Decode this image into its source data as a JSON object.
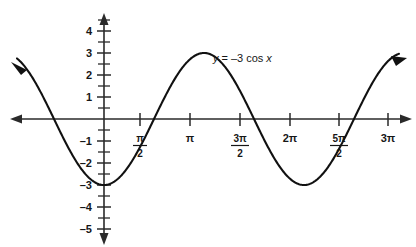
{
  "figure": {
    "background_color": "#ffffff",
    "ink_color": "#111111"
  },
  "chart_data": {
    "type": "line",
    "title": "",
    "subtitle": "",
    "xlabel": "",
    "ylabel": "",
    "equation": "y = -3 cos x",
    "function": "y = -3cos(x)",
    "amplitude": 3,
    "period": "2π",
    "grid": false,
    "legend": null,
    "xlim": [
      -1.5708,
      9.8
    ],
    "ylim": [
      -5,
      4.6
    ],
    "x_tick_labels": [
      "π/2",
      "π",
      "3π/2",
      "2π",
      "5π/2",
      "3π"
    ],
    "x_tick_values": [
      1.5708,
      3.1416,
      4.7124,
      6.2832,
      7.854,
      9.4248
    ],
    "y_tick_labels": [
      "4",
      "3",
      "2",
      "1",
      "-1",
      "-2",
      "-3",
      "-4",
      "-5"
    ],
    "y_tick_values": [
      4,
      3,
      2,
      1,
      -1,
      -2,
      -3,
      -4,
      -5
    ],
    "y_minor_tick_step": 0.5,
    "key_points": [
      {
        "x": 0,
        "y": -3,
        "note": "minimum"
      },
      {
        "x": 1.5708,
        "y": 0,
        "note": "zero crossing"
      },
      {
        "x": 3.1416,
        "y": 3,
        "note": "maximum"
      },
      {
        "x": 4.7124,
        "y": 0,
        "note": "zero crossing"
      },
      {
        "x": 6.2832,
        "y": -3,
        "note": "minimum"
      },
      {
        "x": 7.854,
        "y": 0,
        "note": "zero crossing"
      },
      {
        "x": 9.4248,
        "y": 3,
        "note": "maximum"
      }
    ],
    "arrows": {
      "curve_left": true,
      "curve_right": true,
      "x_axis_left": true,
      "x_axis_right": true,
      "y_axis_up": true,
      "y_axis_down": true
    }
  },
  "x_axis": {
    "ticks": [
      {
        "label_type": "fraction",
        "num": "π",
        "den": "2",
        "value": 1.5708
      },
      {
        "label_type": "plain",
        "text": "π",
        "value": 3.1416
      },
      {
        "label_type": "fraction",
        "num": "3π",
        "den": "2",
        "value": 4.7124
      },
      {
        "label_type": "plain",
        "text": "2π",
        "value": 6.2832
      },
      {
        "label_type": "fraction",
        "num": "5π",
        "den": "2",
        "value": 7.854
      },
      {
        "label_type": "plain",
        "text": "3π",
        "value": 9.4248
      }
    ]
  },
  "y_axis": {
    "ticks": [
      {
        "text": "4",
        "value": 4
      },
      {
        "text": "3",
        "value": 3
      },
      {
        "text": "2",
        "value": 2
      },
      {
        "text": "1",
        "value": 1
      },
      {
        "text": "–1",
        "value": -1
      },
      {
        "text": "–2",
        "value": -2
      },
      {
        "text": "–3",
        "value": -3
      },
      {
        "text": "–4",
        "value": -4
      },
      {
        "text": "–5",
        "value": -5
      }
    ]
  },
  "annotation": {
    "equation_y": "y",
    "equation_eq": "=",
    "equation_rhs": "–3 cos",
    "equation_var": "x",
    "equation_full": "y = –3 cos x"
  }
}
